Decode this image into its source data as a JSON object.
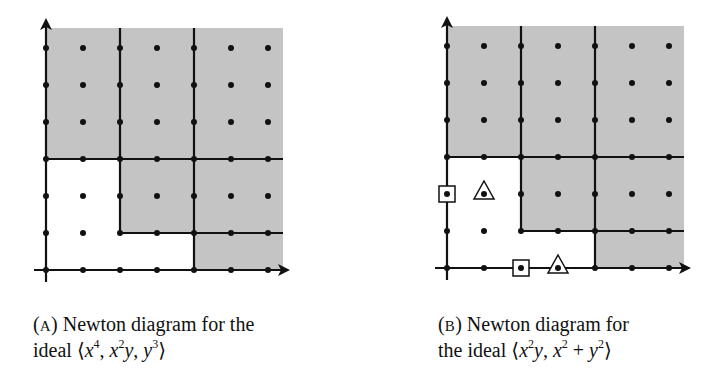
{
  "figure_a": {
    "label": "(A)",
    "label_letter": "A",
    "caption_line1_rest": "Newton diagram for the",
    "caption_line2_prefix": "ideal",
    "ideal_generators": [
      "x^4",
      "x^2y",
      "y^3"
    ],
    "ideal_text": "⟨x⁴, x²y, y³⟩",
    "staircase_corners": [
      [
        0,
        3
      ],
      [
        2,
        3
      ],
      [
        2,
        1
      ],
      [
        4,
        1
      ],
      [
        4,
        0
      ]
    ],
    "grid": {
      "cols": 7,
      "rows": 7
    },
    "shade_color": "#c4c4c4"
  },
  "figure_b": {
    "label": "(B)",
    "label_letter": "B",
    "caption_line1_rest": "Newton diagram for",
    "caption_line2_prefix": "the ideal",
    "ideal_generators": [
      "x^2y",
      "x^2 + y^2"
    ],
    "ideal_text": "⟨x²y, x² + y²⟩",
    "staircase_corners": [
      [
        0,
        3
      ],
      [
        2,
        3
      ],
      [
        2,
        1
      ],
      [
        4,
        1
      ],
      [
        4,
        0
      ]
    ],
    "square_markers": [
      [
        0,
        2
      ],
      [
        2,
        0
      ]
    ],
    "triangle_markers": [
      [
        1,
        2
      ],
      [
        3,
        0
      ]
    ],
    "grid": {
      "cols": 7,
      "rows": 7
    },
    "shade_color": "#c4c4c4"
  },
  "captions": {
    "a_line1": "Newton diagram for the",
    "a_line2_word": "ideal",
    "b_line1": "Newton diagram for",
    "b_line2_word": "the ideal",
    "a_letter": "A",
    "b_letter": "B"
  }
}
